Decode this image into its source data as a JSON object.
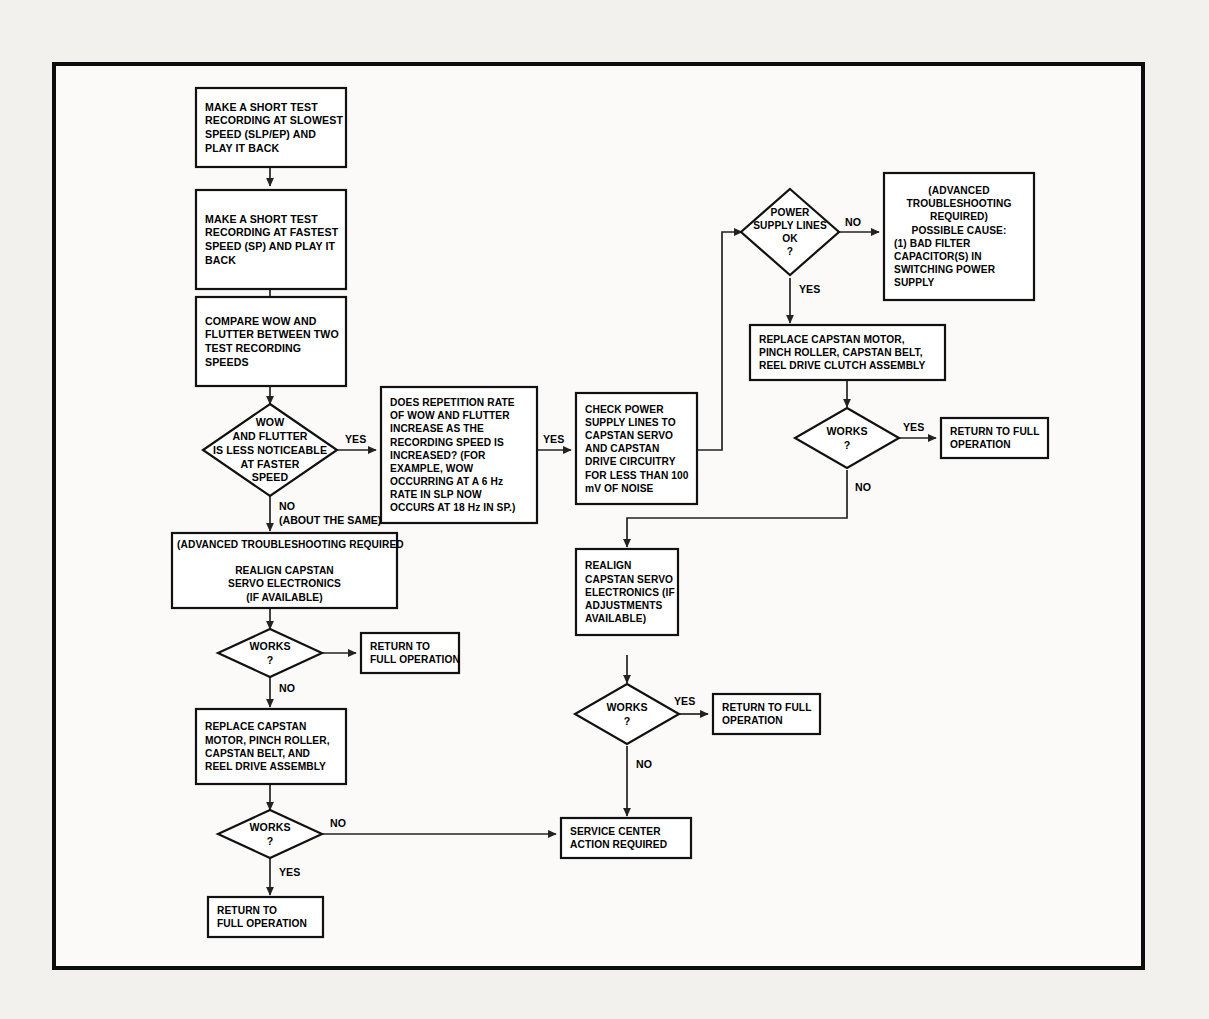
{
  "document": {
    "kind": "troubleshooting-flowchart",
    "subject": "VCR wow and flutter capstan servo troubleshooting",
    "frame_color": "#0d0d0d",
    "page_background": "#f2f1ee",
    "sheet_background": "#fbfaf8"
  },
  "nodes": {
    "test_slowest": {
      "type": "process",
      "align": "left",
      "lines": [
        "MAKE A SHORT TEST",
        "RECORDING AT SLOWEST",
        "SPEED (SLP/EP) AND",
        "PLAY IT BACK"
      ]
    },
    "test_fastest": {
      "type": "process",
      "align": "left",
      "lines": [
        "MAKE A SHORT TEST",
        "RECORDING AT FASTEST",
        "SPEED (SP) AND PLAY IT",
        "BACK"
      ]
    },
    "compare": {
      "type": "process",
      "align": "left",
      "lines": [
        "COMPARE WOW AND",
        "FLUTTER BETWEEN TWO",
        "TEST RECORDING",
        "SPEEDS"
      ]
    },
    "wow_decision": {
      "type": "decision",
      "align": "center",
      "lines": [
        "WOW",
        "AND FLUTTER",
        "IS LESS NOTICEABLE",
        "AT FASTER",
        "SPEED"
      ]
    },
    "repetition_rate": {
      "type": "process",
      "align": "left",
      "lines": [
        "DOES REPETITION RATE",
        "OF WOW AND FLUTTER",
        "INCREASE AS THE",
        "RECORDING SPEED IS",
        "INCREASED? (FOR",
        "EXAMPLE, WOW",
        "OCCURRING AT A 6 Hz",
        "RATE IN SLP NOW",
        "OCCURS AT 18 Hz IN SP.)"
      ]
    },
    "check_power": {
      "type": "process",
      "align": "left",
      "lines": [
        "CHECK POWER",
        "SUPPLY LINES TO",
        "CAPSTAN SERVO",
        "AND CAPSTAN",
        "DRIVE CIRCUITRY",
        "FOR LESS THAN 100",
        "mV OF NOISE"
      ]
    },
    "power_ok_decision": {
      "type": "decision",
      "align": "center",
      "lines": [
        "POWER",
        "SUPPLY LINES",
        "OK",
        "?"
      ]
    },
    "advanced_cause": {
      "type": "process",
      "align": "mixed",
      "lines": [
        "(ADVANCED",
        "TROUBLESHOOTING",
        "REQUIRED)",
        "POSSIBLE CAUSE:",
        "(1)  BAD FILTER",
        "CAPACITOR(S) IN",
        "SWITCHING POWER",
        "SUPPLY"
      ],
      "centered_line_count": 4
    },
    "replace_capstan_clutch": {
      "type": "process",
      "align": "left",
      "lines": [
        "REPLACE CAPSTAN MOTOR,",
        "PINCH ROLLER, CAPSTAN BELT,",
        "REEL DRIVE CLUTCH ASSEMBLY"
      ]
    },
    "works_topright": {
      "type": "decision",
      "align": "center",
      "lines": [
        "WORKS",
        "?"
      ]
    },
    "return_full_topright": {
      "type": "process",
      "align": "left",
      "lines": [
        "RETURN TO FULL",
        "OPERATION"
      ]
    },
    "advanced_realign_left": {
      "type": "process",
      "align": "mixed",
      "lines": [
        "(ADVANCED TROUBLESHOOTING REQUIRED",
        "",
        "REALIGN CAPSTAN",
        "SERVO ELECTRONICS",
        "(IF AVAILABLE)"
      ],
      "first_line_left": true
    },
    "works_left_upper": {
      "type": "decision",
      "align": "center",
      "lines": [
        "WORKS",
        "?"
      ]
    },
    "return_full_left_upper": {
      "type": "process",
      "align": "left",
      "lines": [
        "RETURN TO",
        "FULL OPERATION"
      ]
    },
    "replace_capstan_left": {
      "type": "process",
      "align": "left",
      "lines": [
        "REPLACE CAPSTAN",
        "MOTOR, PINCH ROLLER,",
        "CAPSTAN BELT, AND",
        "REEL DRIVE ASSEMBLY"
      ]
    },
    "works_left_lower": {
      "type": "decision",
      "align": "center",
      "lines": [
        "WORKS",
        "?"
      ]
    },
    "return_full_left_lower": {
      "type": "process",
      "align": "left",
      "lines": [
        "RETURN TO",
        "FULL OPERATION"
      ]
    },
    "realign_mid": {
      "type": "process",
      "align": "left",
      "lines": [
        "REALIGN",
        "CAPSTAN SERVO",
        "ELECTRONICS (IF",
        "ADJUSTMENTS",
        "AVAILABLE)"
      ]
    },
    "works_mid": {
      "type": "decision",
      "align": "center",
      "lines": [
        "WORKS",
        "?"
      ]
    },
    "return_full_mid": {
      "type": "process",
      "align": "left",
      "lines": [
        "RETURN TO FULL",
        "OPERATION"
      ]
    },
    "service_center": {
      "type": "process",
      "align": "left",
      "lines": [
        "SERVICE CENTER",
        "ACTION REQUIRED"
      ]
    }
  },
  "edge_labels": {
    "wow_yes": "YES",
    "wow_no": "NO",
    "wow_no_note": "(ABOUT THE SAME)",
    "repetition_yes": "YES",
    "power_no": "NO",
    "power_yes": "YES",
    "works_topright_yes": "YES",
    "works_topright_no": "NO",
    "works_left_upper_no": "NO",
    "works_left_lower_no": "NO",
    "works_left_lower_yes": "YES",
    "works_mid_yes": "YES",
    "works_mid_no": "NO"
  }
}
